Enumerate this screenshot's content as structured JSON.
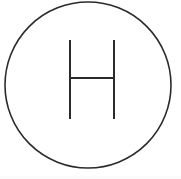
{
  "canvas": {
    "width": 181,
    "height": 179,
    "background_color": "#ffffff"
  },
  "logo": {
    "name": "circled-letter-h-logo",
    "alt_text": "H",
    "letter": "H",
    "stroke_color": "#2b2b2b",
    "fill_color": "none",
    "circle": {
      "center_x": 88,
      "center_y": 85,
      "radius": 83,
      "stroke_width": 1.6
    },
    "letter_strokes": {
      "stroke_width": 2,
      "left_vertical": {
        "x": 70,
        "y_top": 40,
        "y_bottom": 119
      },
      "right_vertical": {
        "x": 114,
        "y_top": 40,
        "y_bottom": 119
      },
      "crossbar": {
        "y": 78,
        "x_start": 70,
        "x_end": 114
      }
    }
  },
  "bottom_band": {
    "color": "#fbfbfb",
    "height": 3
  }
}
